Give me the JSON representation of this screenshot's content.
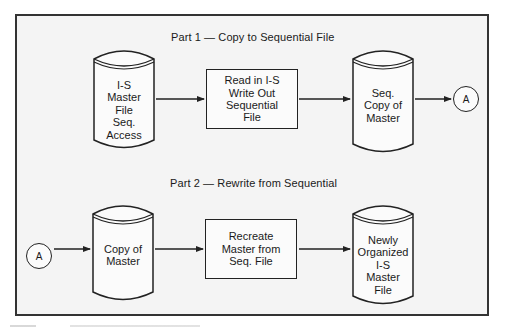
{
  "diagram": {
    "part1": {
      "title": "Part 1 — Copy to Sequential File",
      "input_file": {
        "lines": [
          "I-S",
          "Master",
          "File",
          "Seq.",
          "Access"
        ],
        "shape": "disk-cylinder"
      },
      "process": {
        "lines": [
          "Read in I-S",
          "Write Out",
          "Sequential",
          "File"
        ],
        "shape": "rectangle"
      },
      "output_file": {
        "lines": [
          "Seq.",
          "Copy of",
          "Master"
        ],
        "shape": "disk-cylinder"
      },
      "connector": {
        "label": "A",
        "shape": "circle"
      }
    },
    "part2": {
      "title": "Part 2 — Rewrite from Sequential",
      "connector": {
        "label": "A",
        "shape": "circle"
      },
      "input_file": {
        "lines": [
          "Copy of",
          "Master"
        ],
        "shape": "disk-cylinder"
      },
      "process": {
        "lines": [
          "Recreate",
          "Master from",
          "Seq. File"
        ],
        "shape": "rectangle"
      },
      "output_file": {
        "lines": [
          "Newly",
          "Organized",
          "I-S",
          "Master",
          "File"
        ],
        "shape": "disk-cylinder"
      }
    },
    "colors": {
      "frame_border": "#333333",
      "frame_fill": "#f4f4f4",
      "stroke": "#222222"
    }
  }
}
